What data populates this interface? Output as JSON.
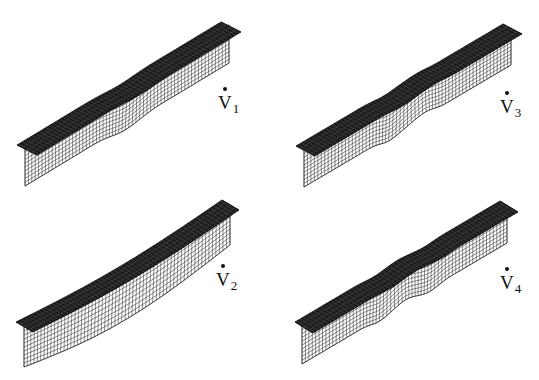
{
  "figure": {
    "panels": [
      {
        "id": "v1",
        "label_main": "V",
        "label_sub": "1",
        "label_pos": [
          218,
          93
        ],
        "near_flange_tip": [
          17,
          145
        ],
        "far_flange_tip": [
          221,
          22
        ],
        "flange_width": [
          20,
          10
        ],
        "web_offset": [
          8,
          3
        ],
        "web_height": 38,
        "mode": "single-bump",
        "bumps": [
          {
            "t": 0.5,
            "amp": 9,
            "width": 0.12
          }
        ]
      },
      {
        "id": "v3",
        "label_main": "V",
        "label_sub": "3",
        "label_pos": [
          500,
          97
        ],
        "near_flange_tip": [
          296,
          146
        ],
        "far_flange_tip": [
          503,
          24
        ],
        "flange_width": [
          19,
          10
        ],
        "web_offset": [
          8,
          4
        ],
        "web_height": 37,
        "mode": "double-bump",
        "bumps": [
          {
            "t": 0.42,
            "amp": 8,
            "width": 0.08
          },
          {
            "t": 0.58,
            "amp": -7,
            "width": 0.08
          }
        ]
      },
      {
        "id": "v2",
        "label_main": "V",
        "label_sub": "2",
        "label_pos": [
          216,
          270
        ],
        "near_flange_tip": [
          16,
          322
        ],
        "far_flange_tip": [
          222,
          200
        ],
        "flange_width": [
          17,
          10
        ],
        "web_offset": [
          8,
          5
        ],
        "web_height": 40,
        "mode": "global-bow",
        "bumps": [
          {
            "t": 0.5,
            "amp": 10,
            "width": 0.45
          }
        ]
      },
      {
        "id": "v4",
        "label_main": "V",
        "label_sub": "4",
        "label_pos": [
          500,
          273
        ],
        "near_flange_tip": [
          295,
          322
        ],
        "far_flange_tip": [
          500,
          201
        ],
        "flange_width": [
          18,
          11
        ],
        "web_offset": [
          7,
          4
        ],
        "web_height": 38,
        "mode": "triple-bump",
        "bumps": [
          {
            "t": 0.38,
            "amp": 6,
            "width": 0.07
          },
          {
            "t": 0.5,
            "amp": -6,
            "width": 0.07
          },
          {
            "t": 0.63,
            "amp": 6,
            "width": 0.07
          }
        ]
      }
    ],
    "mesh": {
      "longitudinal_divisions": 60,
      "web_divisions": 10,
      "flange_divisions": 4,
      "line_color": "#1a1a1a",
      "flange_fill": "#2a2a2a",
      "web_fill": "#ffffff"
    }
  }
}
